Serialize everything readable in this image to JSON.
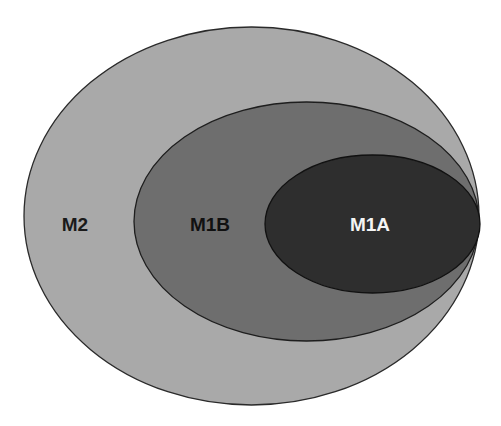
{
  "diagram": {
    "type": "nested-ellipses",
    "regions": [
      {
        "id": "M2",
        "label": "M2",
        "fill": "#a9a9a9",
        "stroke": "#2a2a2a",
        "label_color": "#1a1a1a",
        "ellipse": {
          "cx": 251.5,
          "cy": 216,
          "rx": 227.5,
          "ry": 189
        },
        "label_pos": {
          "x": 75,
          "y": 231
        }
      },
      {
        "id": "M1B",
        "label": "M1B",
        "fill": "#6e6e6e",
        "stroke": "#1e1e1e",
        "label_color": "#111111",
        "ellipse": {
          "cx": 306.5,
          "cy": 221.5,
          "rx": 172.5,
          "ry": 119.5
        },
        "label_pos": {
          "x": 210,
          "y": 231
        }
      },
      {
        "id": "M1A",
        "label": "M1A",
        "fill": "#2e2e2e",
        "stroke": "#111111",
        "label_color": "#f4f4f4",
        "ellipse": {
          "cx": 372.5,
          "cy": 224,
          "rx": 107.5,
          "ry": 69
        },
        "label_pos": {
          "x": 370,
          "y": 231
        }
      }
    ]
  }
}
